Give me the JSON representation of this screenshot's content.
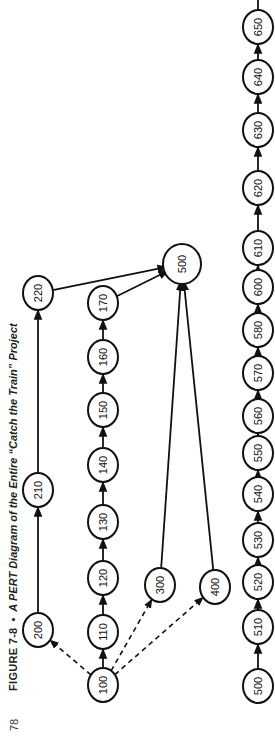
{
  "page": {
    "page_number": "78",
    "figure_label": "FIGURE 7-8",
    "separator": "•",
    "figure_title": "A PERT Diagram of the Entire “Catch the Train” Project"
  },
  "diagram": {
    "type": "PERT network",
    "orientation": "rotated 90° counter-clockwise",
    "colors": {
      "stroke": "#111111",
      "background": "#ffffff"
    },
    "nodes": [
      {
        "id": "100",
        "x": 54,
        "y": 103
      },
      {
        "id": "110",
        "x": 107,
        "y": 103
      },
      {
        "id": "120",
        "x": 161,
        "y": 103
      },
      {
        "id": "130",
        "x": 217,
        "y": 103
      },
      {
        "id": "140",
        "x": 274,
        "y": 103
      },
      {
        "id": "150",
        "x": 329,
        "y": 103
      },
      {
        "id": "160",
        "x": 382,
        "y": 103
      },
      {
        "id": "170",
        "x": 436,
        "y": 103
      },
      {
        "id": "200",
        "x": 109,
        "y": 38
      },
      {
        "id": "210",
        "x": 249,
        "y": 38
      },
      {
        "id": "220",
        "x": 446,
        "y": 38
      },
      {
        "id": "300",
        "x": 154,
        "y": 160
      },
      {
        "id": "400",
        "x": 152,
        "y": 215
      },
      {
        "id": "500",
        "x": 475,
        "y": 182,
        "key": "500a"
      },
      {
        "id": "500",
        "x": 53,
        "y": 258,
        "key": "500b"
      },
      {
        "id": "510",
        "x": 112,
        "y": 258
      },
      {
        "id": "520",
        "x": 157,
        "y": 258
      },
      {
        "id": "530",
        "x": 199,
        "y": 258
      },
      {
        "id": "540",
        "x": 245,
        "y": 258
      },
      {
        "id": "550",
        "x": 286,
        "y": 258
      },
      {
        "id": "560",
        "x": 323,
        "y": 258
      },
      {
        "id": "570",
        "x": 366,
        "y": 258
      },
      {
        "id": "580",
        "x": 409,
        "y": 258
      },
      {
        "id": "600",
        "x": 452,
        "y": 258
      },
      {
        "id": "610",
        "x": 491,
        "y": 258
      },
      {
        "id": "620",
        "x": 551,
        "y": 258
      },
      {
        "id": "630",
        "x": 609,
        "y": 258
      },
      {
        "id": "640",
        "x": 662,
        "y": 258
      },
      {
        "id": "650",
        "x": 712,
        "y": 258
      }
    ],
    "edges": [
      {
        "from": "100",
        "to": "110",
        "style": "solid"
      },
      {
        "from": "110",
        "to": "120",
        "style": "solid"
      },
      {
        "from": "120",
        "to": "130",
        "style": "solid"
      },
      {
        "from": "130",
        "to": "140",
        "style": "solid"
      },
      {
        "from": "140",
        "to": "150",
        "style": "solid"
      },
      {
        "from": "150",
        "to": "160",
        "style": "solid"
      },
      {
        "from": "160",
        "to": "170",
        "style": "solid"
      },
      {
        "from": "170",
        "to": "500a",
        "style": "solid"
      },
      {
        "from": "100",
        "to": "200",
        "style": "dashed"
      },
      {
        "from": "100",
        "to": "300",
        "style": "dashed"
      },
      {
        "from": "100",
        "to": "400",
        "style": "dashed"
      },
      {
        "from": "200",
        "to": "210",
        "style": "solid"
      },
      {
        "from": "210",
        "to": "220",
        "style": "solid"
      },
      {
        "from": "220",
        "to": "500a",
        "style": "solid"
      },
      {
        "from": "300",
        "to": "500a",
        "style": "solid"
      },
      {
        "from": "400",
        "to": "500a",
        "style": "solid"
      },
      {
        "from": "500b",
        "to": "510",
        "style": "solid"
      },
      {
        "from": "510",
        "to": "520",
        "style": "solid"
      },
      {
        "from": "520",
        "to": "530",
        "style": "solid"
      },
      {
        "from": "530",
        "to": "540",
        "style": "solid"
      },
      {
        "from": "540",
        "to": "550",
        "style": "solid"
      },
      {
        "from": "550",
        "to": "560",
        "style": "solid"
      },
      {
        "from": "560",
        "to": "570",
        "style": "solid"
      },
      {
        "from": "570",
        "to": "580",
        "style": "solid"
      },
      {
        "from": "580",
        "to": "600",
        "style": "solid"
      },
      {
        "from": "600",
        "to": "610",
        "style": "solid"
      },
      {
        "from": "610",
        "to": "620",
        "style": "solid"
      },
      {
        "from": "620",
        "to": "630",
        "style": "solid"
      },
      {
        "from": "630",
        "to": "640",
        "style": "solid"
      },
      {
        "from": "640",
        "to": "650",
        "style": "solid"
      },
      {
        "from": "650",
        "to": "continues-off-page",
        "style": "solid"
      }
    ]
  }
}
